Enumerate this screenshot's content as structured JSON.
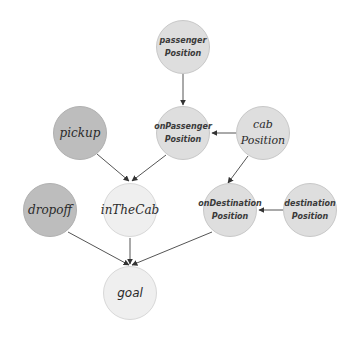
{
  "diagram": {
    "type": "directed-graph",
    "colors": {
      "background": "#ffffff",
      "action_node_fill": "#bdbdbd",
      "state_node_fill": "#dedede",
      "derived_node_fill": "#efefef",
      "node_stroke": "#c8c8c8",
      "edge": "#555555"
    },
    "nodes": {
      "passengerPosition": {
        "line1": "passenger",
        "line2": "Position"
      },
      "onPassengerPosition": {
        "line1": "onPassenger",
        "line2": "Position"
      },
      "cabPosition": {
        "line1": "cab",
        "line2": "Position"
      },
      "pickup": {
        "label": "pickup"
      },
      "onDestinationPosition": {
        "line1": "onDestination",
        "line2": "Position"
      },
      "destinationPosition": {
        "line1": "destination",
        "line2": "Position"
      },
      "dropoff": {
        "label": "dropoff"
      },
      "inTheCab": {
        "label": "inTheCab"
      },
      "goal": {
        "label": "goal"
      }
    },
    "edges": [
      {
        "from": "passengerPosition",
        "to": "onPassengerPosition"
      },
      {
        "from": "cabPosition",
        "to": "onPassengerPosition"
      },
      {
        "from": "cabPosition",
        "to": "onDestinationPosition"
      },
      {
        "from": "destinationPosition",
        "to": "onDestinationPosition"
      },
      {
        "from": "pickup",
        "to": "inTheCab"
      },
      {
        "from": "onPassengerPosition",
        "to": "inTheCab"
      },
      {
        "from": "dropoff",
        "to": "goal"
      },
      {
        "from": "inTheCab",
        "to": "goal"
      },
      {
        "from": "onDestinationPosition",
        "to": "goal"
      }
    ]
  }
}
